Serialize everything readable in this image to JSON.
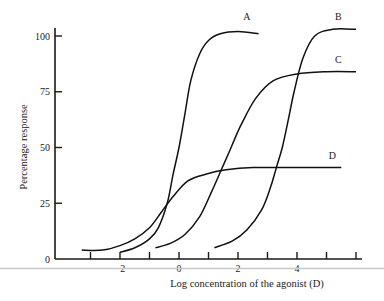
{
  "chart_data": {
    "type": "line",
    "title": "",
    "xlabel": "Log concentration of the agonist (D)",
    "ylabel": "Percentage response",
    "xlim": [
      -3.8,
      6.2
    ],
    "ylim": [
      0,
      100
    ],
    "x_ticks": [
      -3,
      -2,
      -1,
      0,
      1,
      2,
      3,
      4,
      5,
      6
    ],
    "x_tick_labels": [
      {
        "value": -2,
        "label": "−2"
      },
      {
        "value": 0,
        "label": "0"
      },
      {
        "value": 2,
        "label": "2"
      },
      {
        "value": 4,
        "label": "4"
      }
    ],
    "y_ticks": [
      0,
      25,
      50,
      75,
      100
    ],
    "y_tick_labels": [
      "0",
      "25",
      "50",
      "75",
      "100"
    ],
    "grid": false,
    "legend": "inline labels at curve ends",
    "series": [
      {
        "name": "A",
        "x": [
          -2.0,
          -1.5,
          -1.0,
          -0.7,
          -0.4,
          -0.2,
          0.0,
          0.2,
          0.4,
          0.7,
          1.0,
          1.4,
          2.0,
          2.7
        ],
        "values": [
          3,
          5,
          9,
          14,
          25,
          38,
          50,
          65,
          80,
          92,
          98,
          101,
          102,
          101
        ]
      },
      {
        "name": "B",
        "x": [
          1.2,
          1.8,
          2.3,
          2.8,
          3.1,
          3.3,
          3.5,
          3.7,
          3.9,
          4.2,
          4.6,
          5.2,
          6.0
        ],
        "values": [
          5,
          8,
          13,
          22,
          32,
          41,
          50,
          62,
          75,
          90,
          100,
          103,
          103
        ]
      },
      {
        "name": "C",
        "x": [
          -0.8,
          -0.3,
          0.2,
          0.7,
          1.1,
          1.4,
          1.7,
          2.1,
          2.6,
          3.2,
          4.0,
          5.0,
          6.0
        ],
        "values": [
          5,
          7,
          11,
          19,
          30,
          39,
          48,
          60,
          72,
          80,
          83,
          84,
          84
        ]
      },
      {
        "name": "D",
        "x": [
          -3.3,
          -2.6,
          -2.0,
          -1.5,
          -1.0,
          -0.6,
          -0.2,
          0.3,
          0.9,
          1.6,
          2.5,
          3.6,
          5.5
        ],
        "values": [
          4,
          4,
          6,
          9,
          14,
          21,
          28,
          35,
          38,
          40,
          41,
          41,
          41
        ]
      }
    ],
    "curve_label_positions": [
      {
        "name": "A",
        "x": 2.3,
        "y": 107
      },
      {
        "name": "B",
        "x": 5.4,
        "y": 107
      },
      {
        "name": "C",
        "x": 5.4,
        "y": 88
      },
      {
        "name": "D",
        "x": 5.2,
        "y": 45
      }
    ]
  }
}
